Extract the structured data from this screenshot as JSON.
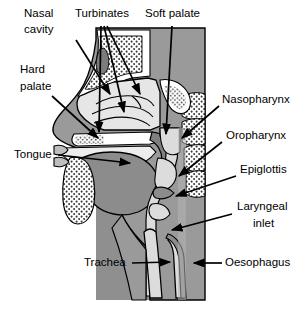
{
  "figure": {
    "background_color": "#ffffff",
    "width": 305,
    "height": 322
  },
  "palette": {
    "outline": "#000000",
    "soft_tissue_dark": "#8a8a8a",
    "soft_tissue_mid": "#9e9e9e",
    "cavity_light": "#e2e2e2",
    "bone_white": "#ffffff",
    "airway_light": "#dcdcdc",
    "background_grey": "#8f8f8f",
    "label_text": "#000000"
  },
  "labels": [
    {
      "id": "nasal-cavity",
      "text_line1": "Nasal",
      "text_line2": "cavity",
      "side": "left",
      "x": 58,
      "y": 14
    },
    {
      "id": "turbinates",
      "text_line1": "Turbinates",
      "text_line2": "",
      "side": "top",
      "x": 75,
      "y": 14
    },
    {
      "id": "soft-palate",
      "text_line1": "Soft palate",
      "text_line2": "",
      "side": "top",
      "x": 145,
      "y": 14
    },
    {
      "id": "hard-palate",
      "text_line1": "Hard",
      "text_line2": "palate",
      "side": "left",
      "x": 20,
      "y": 70
    },
    {
      "id": "tongue",
      "text_line1": "Tongue",
      "text_line2": "",
      "side": "left",
      "x": 14,
      "y": 155
    },
    {
      "id": "trachea",
      "text_line1": "Trachea",
      "text_line2": "",
      "side": "left",
      "x": 84,
      "y": 263
    },
    {
      "id": "nasopharynx",
      "text_line1": "Nasopharynx",
      "text_line2": "",
      "side": "right",
      "x": 222,
      "y": 100
    },
    {
      "id": "oropharynx",
      "text_line1": "Oropharynx",
      "text_line2": "",
      "side": "right",
      "x": 226,
      "y": 136
    },
    {
      "id": "epiglottis",
      "text_line1": "Epiglottis",
      "text_line2": "",
      "side": "right",
      "x": 240,
      "y": 170
    },
    {
      "id": "laryngeal-inlet",
      "text_line1": "Laryngeal",
      "text_line2": "inlet",
      "side": "right",
      "x": 237,
      "y": 207
    },
    {
      "id": "oesophagus",
      "text_line1": "Oesophagus",
      "text_line2": "",
      "side": "right",
      "x": 225,
      "y": 263
    }
  ],
  "label_text": {
    "nasal_cavity_1": "Nasal",
    "nasal_cavity_2": "cavity",
    "turbinates": "Turbinates",
    "soft_palate": "Soft palate",
    "hard_palate_1": "Hard",
    "hard_palate_2": "palate",
    "tongue": "Tongue",
    "trachea": "Trachea",
    "nasopharynx": "Nasopharynx",
    "oropharynx": "Oropharynx",
    "epiglottis": "Epiglottis",
    "laryngeal_1": "Laryngeal",
    "laryngeal_2": "inlet",
    "oesophagus": "Oesophagus"
  },
  "anatomy_parts": [
    "nasal-cavity",
    "turbinates",
    "soft-palate",
    "hard-palate",
    "tongue",
    "trachea",
    "nasopharynx",
    "oropharynx",
    "epiglottis",
    "laryngeal-inlet",
    "oesophagus",
    "sphenoid-sinus",
    "frontal-sinus",
    "mandible",
    "vertebral-column"
  ],
  "leader_lines": {
    "count": 13,
    "style": "solid black arrow with filled triangular head"
  }
}
